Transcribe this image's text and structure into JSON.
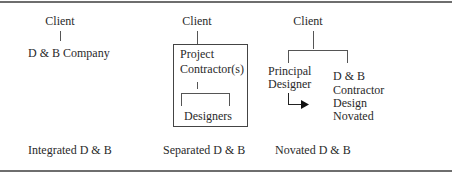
{
  "diagrams": [
    {
      "id": "integrated",
      "top": "Client",
      "node": "D & B Company",
      "caption": "Integrated D & B"
    },
    {
      "id": "separated",
      "top": "Client",
      "box_label_line1": "Project",
      "box_label_line2": "Contractor(s)",
      "sub_node": "Designers",
      "caption": "Separated D & B"
    },
    {
      "id": "novated",
      "top": "Client",
      "left_node_line1": "Principal",
      "left_node_line2": "Designer",
      "right_node_line1": "D & B",
      "right_node_line2": "Contractor",
      "right_node_line3": "Design",
      "right_node_line4": "Novated",
      "caption": "Novated D & B"
    }
  ]
}
